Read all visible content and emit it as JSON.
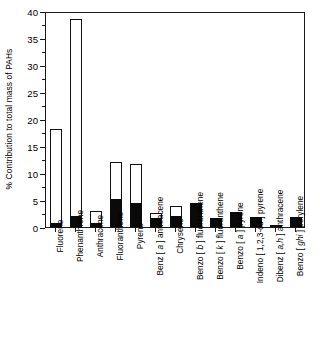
{
  "chart_data": {
    "type": "bar",
    "subtype": "stacked-bar",
    "title": "",
    "xlabel": "",
    "ylabel": "% Contribution to total mass of PAHs",
    "ylim": [
      0,
      40
    ],
    "ytick_step": 5,
    "yticks": [
      "0",
      "5",
      "10",
      "15",
      "20",
      "25",
      "30",
      "35",
      "40"
    ],
    "minor_ticks": true,
    "grid": false,
    "legend": "none",
    "categories": [
      "Fluorene",
      "Phenanthrene",
      "Anthracene",
      "Fluoranthene",
      "Pyrene",
      "Benz [ a ] anthracene",
      "Chrysene",
      "Benzo [ b ] fluoranthene",
      "Benzo [ k ] fluoranthene",
      "Benzo [ a ] pyrene",
      "Indeno [ 1,2,3-cd ] pyrene",
      "Dibenz [ a,h ] anthracene",
      "Benzo [ ghi ] perylene"
    ],
    "category_parts": [
      {
        "pre": "Fluorene",
        "it": "",
        "post": ""
      },
      {
        "pre": "Phenanthrene",
        "it": "",
        "post": ""
      },
      {
        "pre": "Anthracene",
        "it": "",
        "post": ""
      },
      {
        "pre": "Fluoranthene",
        "it": "",
        "post": ""
      },
      {
        "pre": "Pyrene",
        "it": "",
        "post": ""
      },
      {
        "pre": "Benz [ ",
        "it": "a",
        "post": " ] anthracene"
      },
      {
        "pre": "Chrysene",
        "it": "",
        "post": ""
      },
      {
        "pre": "Benzo [ ",
        "it": "b",
        "post": " ] fluoranthene"
      },
      {
        "pre": "Benzo [ ",
        "it": "k",
        "post": " ] fluoranthene"
      },
      {
        "pre": "Benzo [ ",
        "it": "a",
        "post": " ] pyrene"
      },
      {
        "pre": "Indeno [ 1,2,3-",
        "it": "cd",
        "post": " ] pyrene"
      },
      {
        "pre": "Dibenz [ ",
        "it": "a,h",
        "post": " ] anthracene"
      },
      {
        "pre": "Benzo [ ",
        "it": "ghi",
        "post": " ] perylene"
      }
    ],
    "series": [
      {
        "name": "solid (filled portion)",
        "color": "#0a0a0a",
        "values": [
          0.8,
          2.0,
          0.7,
          5.1,
          4.5,
          1.6,
          2.1,
          4.5,
          1.7,
          2.7,
          1.9,
          0.2,
          1.8
        ]
      },
      {
        "name": "total (open bar outline)",
        "color": "#ffffff",
        "values": [
          18.2,
          38.5,
          2.9,
          12.0,
          11.6,
          2.6,
          3.9,
          4.5,
          1.7,
          2.7,
          1.9,
          0.2,
          1.8
        ]
      }
    ]
  },
  "figure": {
    "axis_color": "#1a1a1a",
    "bar_fill_color": "#0a0a0a",
    "bar_open_color": "#ffffff",
    "background": "#ffffff"
  }
}
